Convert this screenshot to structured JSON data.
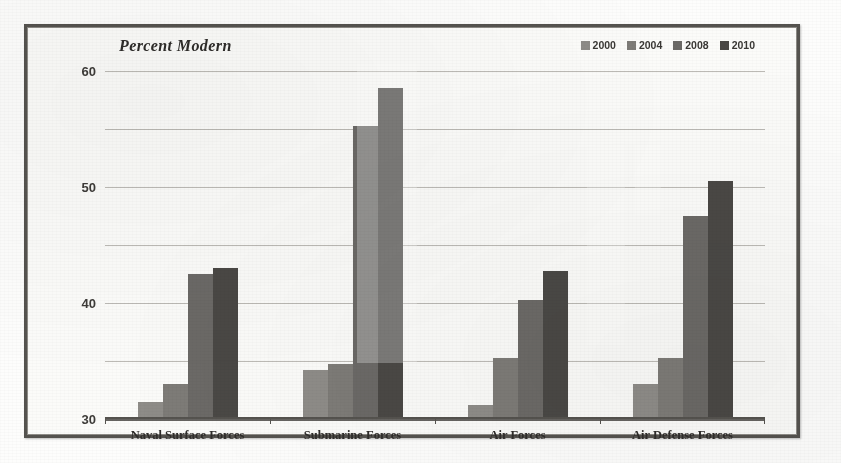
{
  "chart": {
    "title": "Percent Modern",
    "frame_border_color": "#55534f",
    "background_color": "#fbfbf9"
  },
  "legend": {
    "position": "top-right",
    "entries": [
      {
        "label": "2000",
        "color": "#8e8c88"
      },
      {
        "label": "2004",
        "color": "#7d7b77"
      },
      {
        "label": "2008",
        "color": "#6b6966"
      },
      {
        "label": "2010",
        "color": "#4a4845"
      }
    ]
  },
  "axes": {
    "y_ticks": [
      "60",
      "50",
      "40",
      "30",
      "20",
      "10",
      "0"
    ],
    "y_min": 0,
    "y_max": 60,
    "y_step": 10
  },
  "chart_data": {
    "type": "bar",
    "title": "Percent Modern",
    "xlabel": "",
    "ylabel": "",
    "ylim": [
      0,
      60
    ],
    "grid": true,
    "legend_position": "top-right",
    "categories": [
      "Naval Surface Forces",
      "Submarine Forces",
      "Air Forces",
      "Air Defense Forces"
    ],
    "series": [
      {
        "name": "2000",
        "color": "#8e8c88",
        "values": [
          3,
          8.5,
          2.5,
          6
        ]
      },
      {
        "name": "2004",
        "color": "#7d7b77",
        "values": [
          6,
          9.5,
          10.5,
          10.5
        ]
      },
      {
        "name": "2008",
        "color": "#6b6966",
        "values": [
          25,
          50.5,
          20.5,
          35
        ]
      },
      {
        "name": "2010",
        "color": "#4a4845",
        "values": [
          26,
          57,
          25.5,
          41
        ]
      }
    ]
  }
}
